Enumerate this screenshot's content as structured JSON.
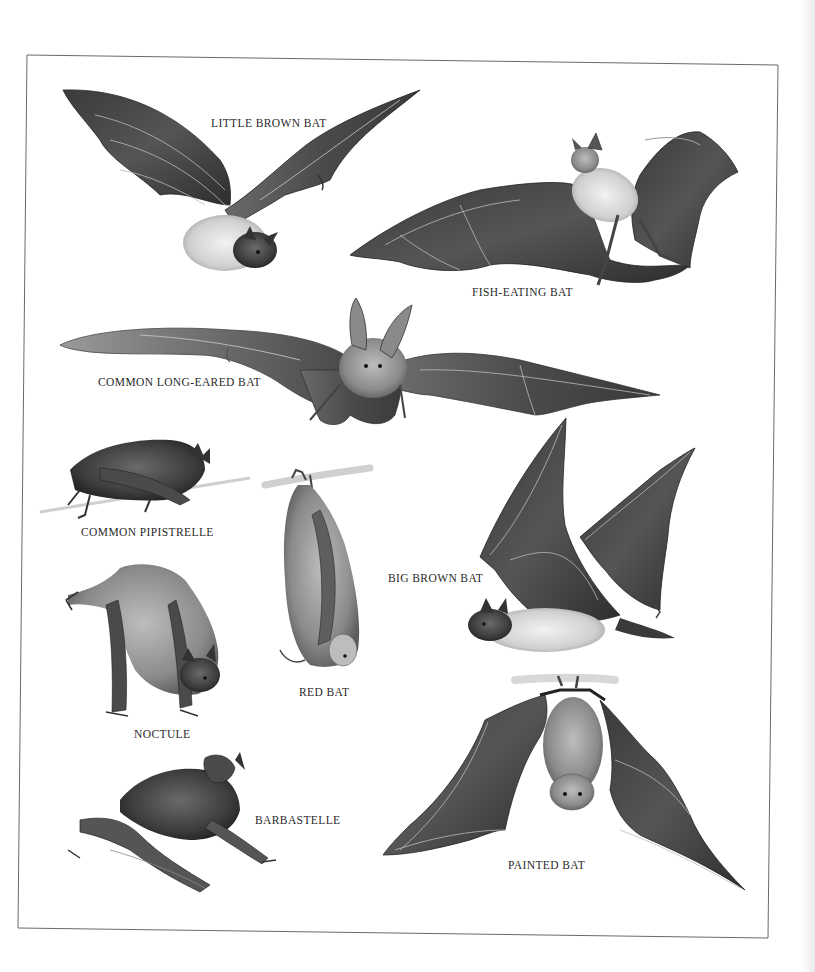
{
  "plate": {
    "background": "#ffffff",
    "frame_color": "#6a6a6a",
    "ink_color": "#2a2a2a",
    "labels": {
      "little_brown_bat": "LITTLE BROWN BAT",
      "fish_eating_bat": "FISH-EATING BAT",
      "common_long_eared_bat": "COMMON LONG-EARED BAT",
      "common_pipistrelle": "COMMON PIPISTRELLE",
      "red_bat": "RED BAT",
      "big_brown_bat": "BIG BROWN BAT",
      "noctule": "NOCTULE",
      "barbastelle": "BARBASTELLE",
      "painted_bat": "PAINTED BAT"
    },
    "illustrations": [
      {
        "id": "little-brown-bat",
        "pose": "flying"
      },
      {
        "id": "fish-eating-bat",
        "pose": "flying"
      },
      {
        "id": "common-long-eared-bat",
        "pose": "flying, wings spread"
      },
      {
        "id": "common-pipistrelle",
        "pose": "crawling on branch"
      },
      {
        "id": "red-bat",
        "pose": "hanging from branch"
      },
      {
        "id": "big-brown-bat",
        "pose": "flying"
      },
      {
        "id": "noctule",
        "pose": "climbing"
      },
      {
        "id": "barbastelle",
        "pose": "crouching"
      },
      {
        "id": "painted-bat",
        "pose": "hanging, wings open"
      }
    ]
  }
}
